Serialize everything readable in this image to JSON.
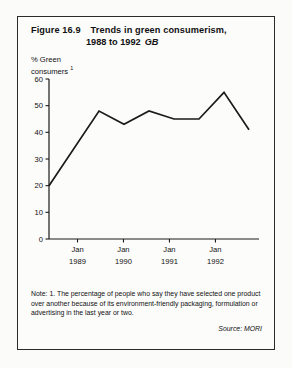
{
  "figure": {
    "number": "Figure 16.9",
    "title_line1": "Trends in green consumerism,",
    "title_line2": "1988 to 1992",
    "geography": "GB",
    "y_axis_caption_line1": "% Green",
    "y_axis_caption_line2": "consumers",
    "y_axis_caption_footnote_marker": "1",
    "note": "Note: 1. The percentage of people who say they have selected one product over another because of its environment-friendly packaging, formulation or advertising in the last year or two.",
    "source": "Source: MORI"
  },
  "chart_data": {
    "type": "line",
    "xlabel": "",
    "ylabel": "% Green consumers",
    "ylim": [
      0,
      60
    ],
    "yticks": [
      0,
      10,
      20,
      30,
      40,
      50,
      60
    ],
    "ytick_labels": [
      "0",
      "10",
      "20",
      "30",
      "40",
      "50",
      "60"
    ],
    "xticks": [
      "Jan 1989",
      "Jan 1990",
      "Jan 1991",
      "Jan 1992"
    ],
    "xtick_labels_top": [
      "Jan",
      "Jan",
      "Jan",
      "Jan"
    ],
    "xtick_labels_bottom": [
      "1989",
      "1990",
      "1991",
      "1992"
    ],
    "grid": false,
    "legend": null,
    "series": [
      {
        "name": "% Green consumers",
        "color": "#1a1a1a",
        "x": [
          0.0,
          1.0,
          1.5,
          2.0,
          2.5,
          3.0,
          3.5,
          4.0
        ],
        "x_dates": [
          "Jul 1988",
          "Jul 1989",
          "Jan 1990",
          "Jul 1990",
          "Jan 1991",
          "Jul 1991",
          "Jan 1992",
          "Jul 1992"
        ],
        "values": [
          20,
          48,
          43,
          48,
          45,
          45,
          55,
          41
        ]
      }
    ]
  }
}
